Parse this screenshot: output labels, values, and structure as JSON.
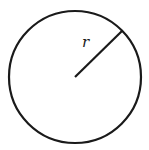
{
  "diagram": {
    "type": "circle-with-radius",
    "radius_label": "r",
    "stroke_color": "#1a1a1a",
    "background_color": "#ffffff"
  }
}
